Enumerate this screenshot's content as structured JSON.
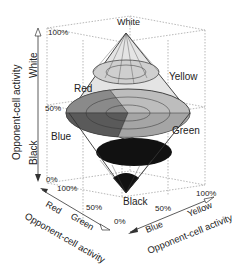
{
  "diagram": {
    "type": "3d-opponent-color-space",
    "vertical_axis": {
      "title": "Opponent-cell activity",
      "top_label": "White",
      "bottom_label": "Black",
      "ticks": [
        "100%",
        "50%",
        "0%"
      ]
    },
    "left_axis": {
      "title": "Opponent-cell activity",
      "label_a": "Red",
      "label_b": "Green",
      "ticks": [
        "100%",
        "50%",
        "0%"
      ]
    },
    "right_axis": {
      "title": "Opponent-cell activity",
      "label_a": "Blue",
      "label_b": "Yellow",
      "ticks": [
        "0%",
        "50%",
        "100%"
      ]
    },
    "solid_labels": {
      "top": "White",
      "bottom": "Black",
      "red": "Red",
      "yellow": "Yellow",
      "blue": "Blue",
      "green": "Green"
    },
    "colors": {
      "line": "#333333",
      "grid": "#9a9a9a",
      "dark_fill": "#111111",
      "mid_fill": "#6a6a6a",
      "light_fill": "#bdbdbd",
      "lighter_fill": "#d9d9d9"
    }
  }
}
